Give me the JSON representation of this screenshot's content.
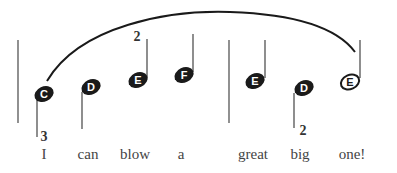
{
  "notes": [
    {
      "name": "C",
      "filled": true,
      "x": 44,
      "y": 94,
      "stem": "down"
    },
    {
      "name": "D",
      "filled": true,
      "x": 91,
      "y": 87,
      "stem": "down"
    },
    {
      "name": "E",
      "filled": true,
      "x": 138,
      "y": 80,
      "stem": "up"
    },
    {
      "name": "F",
      "filled": true,
      "x": 184,
      "y": 75,
      "stem": "up"
    },
    {
      "name": "E",
      "filled": true,
      "x": 255,
      "y": 81,
      "stem": "up"
    },
    {
      "name": "D",
      "filled": true,
      "x": 304,
      "y": 88,
      "stem": "down"
    },
    {
      "name": "E",
      "filled": false,
      "x": 350,
      "y": 82,
      "stem": "up"
    }
  ],
  "lyrics": [
    "I",
    "can",
    "blow",
    "a",
    "great",
    "big",
    "one!"
  ],
  "fingerings": [
    {
      "label": "3",
      "note_index": 0
    },
    {
      "label": "2",
      "note_index": 2
    },
    {
      "label": "2",
      "note_index": 5
    }
  ],
  "colors": {
    "ink": "#1a1a1a",
    "line": "#444444",
    "text": "#444444"
  }
}
